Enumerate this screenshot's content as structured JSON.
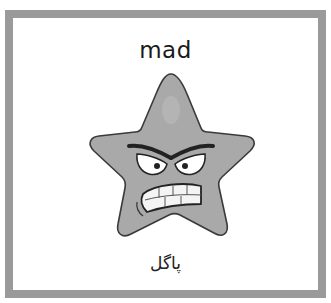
{
  "card": {
    "word_english": "mad",
    "word_translation": "پاگل",
    "image": {
      "icon": "angry-star-icon",
      "description": "gray cartoon star with angry eyebrows, glaring eyes and clenched teeth"
    }
  },
  "colors": {
    "frame": "#9a9a9a",
    "background": "#ffffff",
    "star_fill": "#a9a9a9",
    "outline": "#333333"
  }
}
